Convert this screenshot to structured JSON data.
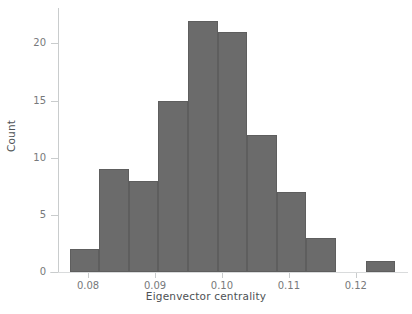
{
  "chart_data": {
    "type": "bar",
    "chart_subtype": "histogram",
    "title": "",
    "xlabel": "Eigenvector centrality",
    "ylabel": "Count",
    "xlim": [
      0.0755,
      0.1272
    ],
    "ylim": [
      0,
      23.1
    ],
    "grid": false,
    "legend": false,
    "bar_color": "#6b6b6b",
    "bar_edge_color": "#5e5e5e",
    "axis_color": "#c9cccd",
    "tick_label_color": "#77797b",
    "axis_label_color": "#4d5154",
    "xticks": [
      0.08,
      0.09,
      0.1,
      0.11,
      0.12
    ],
    "xticklabels": [
      "0.08",
      "0.09",
      "0.10",
      "0.11",
      "0.12"
    ],
    "yticks": [
      0,
      5,
      10,
      15,
      20
    ],
    "yticklabels": [
      "0",
      "5",
      "10",
      "15",
      "20"
    ],
    "bin_width": 0.00442,
    "bin_edges": [
      0.07725,
      0.08167,
      0.08609,
      0.09051,
      0.09493,
      0.09935,
      0.10377,
      0.10819,
      0.11261,
      0.11703,
      0.12145,
      0.12587
    ],
    "categories": [
      "0.0773-0.0817",
      "0.0817-0.0861",
      "0.0861-0.0905",
      "0.0905-0.0949",
      "0.0949-0.0994",
      "0.0994-0.1038",
      "0.1038-0.1082",
      "0.1082-0.1126",
      "0.1126-0.1170",
      "0.1170-0.1215",
      "0.1215-0.1259"
    ],
    "values": [
      2,
      9,
      8,
      15,
      22,
      21,
      12,
      7,
      3,
      0,
      1
    ],
    "bars": [
      {
        "x0": 0.07725,
        "x1": 0.08167,
        "count": 2
      },
      {
        "x0": 0.08167,
        "x1": 0.08609,
        "count": 9
      },
      {
        "x0": 0.08609,
        "x1": 0.09051,
        "count": 8
      },
      {
        "x0": 0.09051,
        "x1": 0.09493,
        "count": 15
      },
      {
        "x0": 0.09493,
        "x1": 0.09935,
        "count": 22
      },
      {
        "x0": 0.09935,
        "x1": 0.10377,
        "count": 21
      },
      {
        "x0": 0.10377,
        "x1": 0.10819,
        "count": 12
      },
      {
        "x0": 0.10819,
        "x1": 0.11261,
        "count": 7
      },
      {
        "x0": 0.11261,
        "x1": 0.11703,
        "count": 3
      },
      {
        "x0": 0.11703,
        "x1": 0.12145,
        "count": 0
      },
      {
        "x0": 0.12145,
        "x1": 0.12587,
        "count": 1
      }
    ],
    "total_count": 100
  }
}
